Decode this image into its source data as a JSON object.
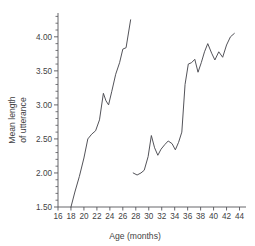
{
  "chart_data": {
    "type": "line",
    "title": "",
    "xlabel": "Age (months)",
    "ylabel": "Mean length of utterance",
    "ylabel_line1": "Mean length",
    "ylabel_line2": "of utterance",
    "xlim": [
      16,
      45
    ],
    "ylim": [
      1.5,
      4.35
    ],
    "grid": false,
    "legend": "none",
    "xticks": [
      16,
      18,
      20,
      22,
      24,
      26,
      28,
      30,
      32,
      34,
      36,
      38,
      40,
      42,
      44
    ],
    "xtick_labels": [
      "16",
      "18",
      "20",
      "22",
      "24",
      "26",
      "28",
      "30",
      "32",
      "34",
      "36",
      "38",
      "40",
      "42",
      "44"
    ],
    "yticks": [
      1.5,
      2.0,
      2.5,
      3.0,
      3.5,
      4.0
    ],
    "ytick_labels": [
      "1.50",
      "2.00",
      "2.50",
      "3.00",
      "3.50",
      "4.00"
    ],
    "yticks_minor_step": 0.1,
    "xticks_minor_step": 1,
    "line_color": "#4a4a50",
    "axis_color": "#55555a",
    "series": [
      {
        "name": "child-1",
        "x": [
          18.0,
          18.6,
          19.3,
          20.0,
          20.6,
          21.2,
          21.8,
          22.4,
          23.0,
          23.4,
          23.8,
          24.3,
          24.9,
          25.5,
          26.0,
          26.5,
          27.2
        ],
        "values": [
          1.5,
          1.72,
          1.95,
          2.22,
          2.5,
          2.57,
          2.62,
          2.78,
          3.17,
          3.06,
          3.0,
          3.2,
          3.45,
          3.62,
          3.82,
          3.84,
          4.25
        ]
      },
      {
        "name": "child-2",
        "x": [
          27.6,
          28.2,
          28.8,
          29.3,
          29.9,
          30.4,
          30.9,
          31.4,
          31.9,
          32.5,
          33.0,
          33.6,
          34.1,
          34.6,
          35.1,
          35.6,
          36.1,
          36.6,
          37.1,
          37.6,
          38.1,
          38.6,
          39.1,
          39.7,
          40.2,
          40.8,
          41.4,
          42.0,
          42.6,
          43.2
        ],
        "values": [
          2.0,
          1.97,
          2.0,
          2.04,
          2.24,
          2.55,
          2.37,
          2.26,
          2.35,
          2.42,
          2.47,
          2.43,
          2.34,
          2.45,
          2.6,
          3.3,
          3.6,
          3.62,
          3.67,
          3.48,
          3.62,
          3.78,
          3.9,
          3.76,
          3.66,
          3.78,
          3.7,
          3.88,
          4.0,
          4.05
        ]
      }
    ]
  },
  "axis_titles": {
    "x": "Age (months)",
    "y_line1": "Mean length",
    "y_line2": "of utterance"
  }
}
